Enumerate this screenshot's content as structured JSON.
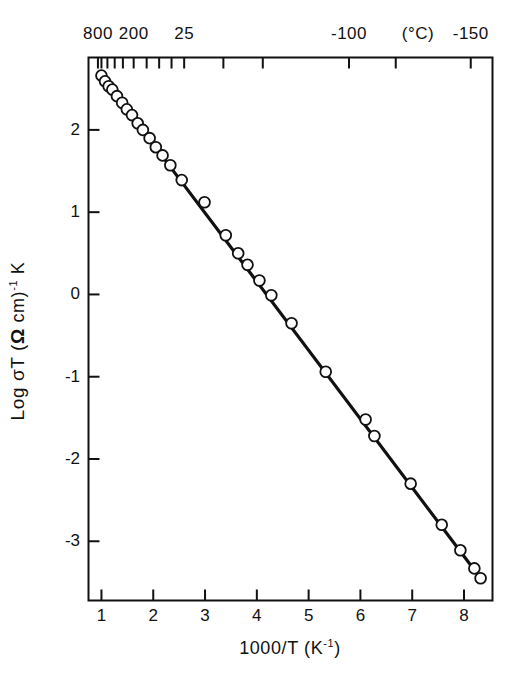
{
  "chart_data": {
    "type": "scatter",
    "title": "",
    "xlabel": "1000/T  (K⁻¹)",
    "ylabel": "Log σT  (Ω cm)⁻¹ K",
    "secondary_xlabel": "(°C)",
    "xlim": [
      0.75,
      8.55
    ],
    "ylim": [
      -3.72,
      2.88
    ],
    "grid": false,
    "legend": null,
    "marker": "open-circle",
    "xticks": [
      1,
      2,
      3,
      4,
      5,
      6,
      7,
      8
    ],
    "xticklabels": [
      "1",
      "2",
      "3",
      "4",
      "5",
      "6",
      "7",
      "8"
    ],
    "yticks": [
      2,
      1,
      0,
      -1,
      -2,
      -3
    ],
    "yticklabels": [
      "2",
      "1",
      "0",
      "-1",
      "-2",
      "-3"
    ],
    "secondary_xticks": [
      0.932,
      1.0,
      1.115,
      1.256,
      1.414,
      1.622,
      1.873,
      2.114,
      2.353,
      2.597,
      3.354,
      4.115,
      5.78,
      6.682,
      8.13
    ],
    "secondary_xticklabels": [
      "800",
      "",
      "",
      "",
      "",
      "200",
      "",
      "",
      "",
      "25",
      "",
      "",
      "-100",
      "",
      "-150"
    ],
    "secondary_xticks_major": [
      {
        "x": 0.932,
        "label": "800"
      },
      {
        "x": 1.622,
        "label": "200"
      },
      {
        "x": 2.597,
        "label": "25"
      },
      {
        "x": 5.78,
        "label": "-100"
      },
      {
        "x": 8.13,
        "label": "-150"
      }
    ],
    "series": [
      {
        "name": "Log sigma-T vs 1000/T",
        "fit_line": {
          "x0": 1.0,
          "y0": 2.66,
          "x1": 8.32,
          "y1": -3.45,
          "slope": -0.835,
          "intercept": 3.495
        },
        "points": [
          [
            1.0,
            2.66
          ],
          [
            1.07,
            2.59
          ],
          [
            1.14,
            2.53
          ],
          [
            1.21,
            2.49
          ],
          [
            1.3,
            2.41
          ],
          [
            1.4,
            2.33
          ],
          [
            1.49,
            2.25
          ],
          [
            1.59,
            2.18
          ],
          [
            1.7,
            2.08
          ],
          [
            1.8,
            2.0
          ],
          [
            1.93,
            1.9
          ],
          [
            2.05,
            1.79
          ],
          [
            2.18,
            1.69
          ],
          [
            2.33,
            1.57
          ],
          [
            2.55,
            1.39
          ],
          [
            2.99,
            1.12
          ],
          [
            3.4,
            0.72
          ],
          [
            3.64,
            0.5
          ],
          [
            3.82,
            0.36
          ],
          [
            4.05,
            0.17
          ],
          [
            4.28,
            -0.01
          ],
          [
            4.67,
            -0.35
          ],
          [
            5.33,
            -0.94
          ],
          [
            6.1,
            -1.52
          ],
          [
            6.27,
            -1.72
          ],
          [
            6.97,
            -2.3
          ],
          [
            7.57,
            -2.8
          ],
          [
            7.93,
            -3.11
          ],
          [
            8.2,
            -3.33
          ],
          [
            8.32,
            -3.45
          ]
        ]
      }
    ]
  },
  "axes": {
    "top": {
      "unit": "(°C)",
      "labels": [
        "800",
        "200",
        "25",
        "-100",
        "-150"
      ]
    },
    "bottom": {
      "title_main": "1000/T  (K",
      "title_sup": "-1",
      "title_tail": ")",
      "labels": [
        "1",
        "2",
        "3",
        "4",
        "5",
        "6",
        "7",
        "8"
      ]
    },
    "left": {
      "title_pre": "Log σT  (",
      "title_omega": "Ω",
      "title_mid": " cm)",
      "title_sup": "-1",
      "title_tail": " K",
      "labels": [
        "2",
        "1",
        "0",
        "-1",
        "-2",
        "-3"
      ]
    }
  },
  "style": {
    "ink": "#111111",
    "background": "#ffffff",
    "marker_fill": "#ffffff",
    "marker_stroke": "#111111",
    "line_color": "#111111"
  }
}
